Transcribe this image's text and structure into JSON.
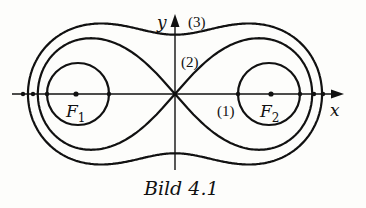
{
  "figure": {
    "caption": "Bild 4.1",
    "axes": {
      "x_label": "x",
      "y_label": "y"
    },
    "foci": [
      {
        "label": "F",
        "subscript": "1"
      },
      {
        "label": "F",
        "subscript": "2"
      }
    ],
    "curves": [
      {
        "id": "1",
        "label": "(1)",
        "kind": "circles around foci"
      },
      {
        "id": "2",
        "label": "(2)",
        "kind": "lemniscate"
      },
      {
        "id": "3",
        "label": "(3)",
        "kind": "outer oval"
      }
    ],
    "colors": {
      "ink": "#111111",
      "background": "#fdfdfb"
    }
  }
}
